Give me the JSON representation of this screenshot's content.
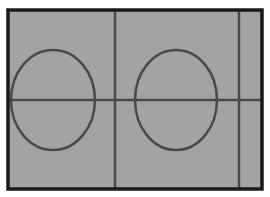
{
  "diagram": {
    "type": "field-layout",
    "colors": {
      "background": "#ffffff",
      "field_fill": "#a3a3a3",
      "frame_stroke": "#1a1a1a",
      "line_stroke": "#4a4a4a"
    },
    "frame": {
      "x": 8,
      "y": 10,
      "width": 254,
      "height": 179,
      "stroke_width": 3.5
    },
    "lines": [
      {
        "id": "horizontal-center-line",
        "x1": 9,
        "y1": 100,
        "x2": 261,
        "y2": 100
      },
      {
        "id": "vertical-line-center",
        "x1": 115,
        "y1": 11,
        "x2": 115,
        "y2": 188
      },
      {
        "id": "vertical-line-right",
        "x1": 239,
        "y1": 11,
        "x2": 239,
        "y2": 188
      }
    ],
    "ellipses": [
      {
        "id": "left-circle",
        "cx": 53,
        "cy": 100,
        "rx": 42,
        "ry": 50
      },
      {
        "id": "right-circle",
        "cx": 176,
        "cy": 100,
        "rx": 41,
        "ry": 50
      }
    ]
  }
}
